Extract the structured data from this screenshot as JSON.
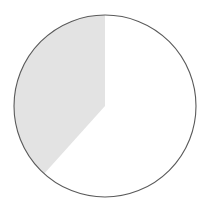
{
  "chart_data": {
    "type": "pie",
    "title": "",
    "subtitle": "",
    "xlabel": "",
    "ylabel": "",
    "grid": false,
    "legend": "none",
    "labels_shown": false,
    "start_angle_deg": 0,
    "direction": "clockwise",
    "categories": [
      "Unshaded sector",
      "Shaded sector"
    ],
    "values": [
      61.7,
      38.3
    ],
    "units": "percent",
    "angles_deg": [
      222,
      138
    ],
    "colors": [
      "#ffffff",
      "#e3e3e3"
    ],
    "slices": [
      {
        "name": "Unshaded sector",
        "value": 61.7,
        "angle_deg": 222,
        "start_deg": 0,
        "end_deg": 222,
        "fill": "#ffffff"
      },
      {
        "name": "Shaded sector",
        "value": 38.3,
        "angle_deg": 138,
        "start_deg": 222,
        "end_deg": 360,
        "fill": "#e3e3e3"
      }
    ]
  },
  "figure": {
    "background": "#ffffff",
    "outline_color": "#5a5a5a",
    "outline_width": 1.1,
    "center_x": 105,
    "center_y": 106,
    "radius": 91,
    "width": 215,
    "height": 211
  },
  "geometry": {
    "slice_path": "M 105 106 L 105 15 A 91 91 0 0 0 44.1 172.6 Z",
    "circle_cx": 105,
    "circle_cy": 106,
    "circle_r": 91
  }
}
